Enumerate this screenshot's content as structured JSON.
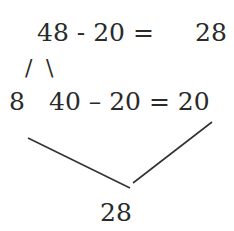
{
  "row1": {
    "expression": "48 - 20 =",
    "result": "28"
  },
  "split": {
    "left_slash": "/",
    "right_slash": "\\"
  },
  "row2": {
    "part_a": "8",
    "expression": "40 – 20 = 20"
  },
  "bottom": {
    "result": "28"
  },
  "colors": {
    "text": "#2a2a2a",
    "line": "#333333",
    "background": "#ffffff"
  }
}
